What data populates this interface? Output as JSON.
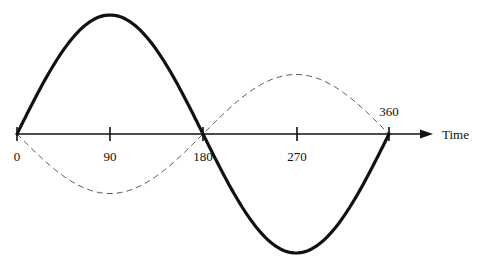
{
  "diagram": {
    "axis_label": "Time",
    "ticks": [
      "0",
      "90",
      "180",
      "270",
      "360"
    ],
    "colors": {
      "stroke": "#111111",
      "dashed": "#555555",
      "background": "#ffffff"
    }
  },
  "chart_data": {
    "type": "line",
    "xlabel": "Time",
    "ylabel": "",
    "x_ticks": [
      0,
      90,
      180,
      270,
      360
    ],
    "xlim": [
      0,
      360
    ],
    "series": [
      {
        "name": "solid-wave",
        "style": "solid-thick",
        "function": "sin(x)",
        "amplitude": 1.0,
        "x": [
          0,
          90,
          180,
          270,
          360
        ],
        "values": [
          0,
          1,
          0,
          -1,
          0
        ]
      },
      {
        "name": "dashed-wave",
        "style": "dashed-thin",
        "function": "-0.5*sin(x)",
        "amplitude": 0.5,
        "x": [
          0,
          90,
          180,
          270,
          360
        ],
        "values": [
          0,
          -0.5,
          0,
          0.5,
          0
        ]
      }
    ]
  }
}
